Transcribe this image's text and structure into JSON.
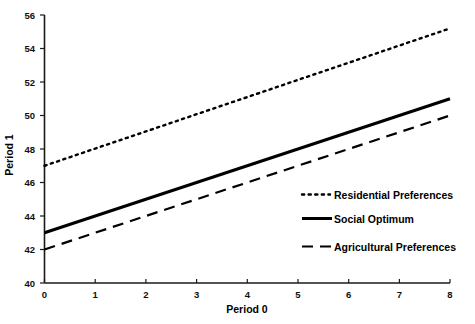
{
  "chart_data": {
    "type": "line",
    "title": "",
    "xlabel": "Period 0",
    "ylabel": "Period 1",
    "xlim": [
      0,
      8
    ],
    "ylim": [
      40,
      56
    ],
    "xticks": [
      0,
      1,
      2,
      3,
      4,
      5,
      6,
      7,
      8
    ],
    "yticks": [
      40,
      42,
      44,
      46,
      48,
      50,
      52,
      54,
      56
    ],
    "xtick_labels": [
      "0",
      "1",
      "2",
      "3",
      "4",
      "5",
      "6",
      "7",
      "8"
    ],
    "ytick_labels": [
      "40",
      "42",
      "44",
      "46",
      "48",
      "50",
      "52",
      "54",
      "56"
    ],
    "grid": false,
    "legend_position": "center-right",
    "x": [
      0,
      8
    ],
    "series": [
      {
        "name": "Residential Preferences",
        "style": "dotted",
        "color": "#000000",
        "values": [
          47.0,
          55.2
        ]
      },
      {
        "name": "Social Optimum",
        "style": "solid",
        "color": "#000000",
        "values": [
          43.0,
          51.0
        ]
      },
      {
        "name": "Agricultural Preferences",
        "style": "dashed",
        "color": "#000000",
        "values": [
          42.0,
          50.0
        ]
      }
    ],
    "legend": [
      {
        "label": "Residential Preferences",
        "style": "dotted"
      },
      {
        "label": "Social Optimum",
        "style": "solid"
      },
      {
        "label": "Agricultural Preferences",
        "style": "dashed"
      }
    ]
  }
}
